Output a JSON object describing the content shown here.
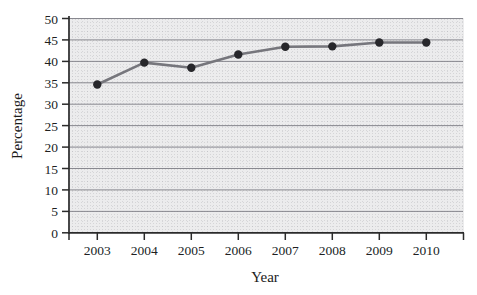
{
  "chart_data": {
    "type": "line",
    "title": "",
    "xlabel": "Year",
    "ylabel": "Percentage",
    "categories": [
      "2003",
      "2004",
      "2005",
      "2006",
      "2007",
      "2008",
      "2009",
      "2010"
    ],
    "x": [
      2003,
      2004,
      2005,
      2006,
      2007,
      2008,
      2009,
      2010
    ],
    "values": [
      34.6,
      39.7,
      38.5,
      41.6,
      43.4,
      43.5,
      44.4,
      44.4
    ],
    "series": [
      {
        "name": "Percentage",
        "values": [
          34.6,
          39.7,
          38.5,
          41.6,
          43.4,
          43.5,
          44.4,
          44.4
        ]
      }
    ],
    "ylim": [
      0,
      50
    ],
    "xlim": [
      2003,
      2010
    ],
    "ytick_labels": [
      "0",
      "5",
      "10",
      "15",
      "20",
      "25",
      "30",
      "35",
      "40",
      "45",
      "50"
    ],
    "ytick_values": [
      0,
      5,
      10,
      15,
      20,
      25,
      30,
      35,
      40,
      45,
      50
    ],
    "xtick_labels": [
      "2003",
      "2004",
      "2005",
      "2006",
      "2007",
      "2008",
      "2009",
      "2010"
    ],
    "grid": "horizontal",
    "legend": "none",
    "line_color": "#76767c",
    "marker_color": "#27272b",
    "gridline_color": "#7d7d84",
    "axis_color": "#2b2b2b",
    "plot_background_color": "#ececed",
    "annotations": []
  }
}
